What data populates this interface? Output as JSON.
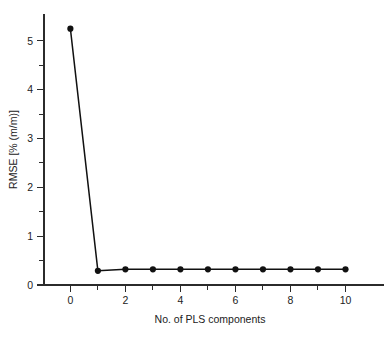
{
  "chart_data": {
    "type": "line",
    "title": "",
    "xlabel": "No. of PLS components",
    "ylabel": "RMSE [% (m/m)]",
    "x": [
      0,
      1,
      2,
      3,
      4,
      5,
      6,
      7,
      8,
      9,
      10
    ],
    "values": [
      5.25,
      0.29,
      0.32,
      0.32,
      0.32,
      0.32,
      0.32,
      0.32,
      0.32,
      0.32,
      0.32
    ],
    "series": [
      {
        "name": "RMSE",
        "values": [
          5.25,
          0.29,
          0.32,
          0.32,
          0.32,
          0.32,
          0.32,
          0.32,
          0.32,
          0.32,
          0.32
        ]
      }
    ],
    "xlim": [
      -0.45,
      10.6
    ],
    "ylim": [
      0,
      5.55
    ],
    "xticks": [
      0,
      2,
      4,
      6,
      8,
      10
    ],
    "xticklabels": [
      "0",
      "2",
      "4",
      "6",
      "8",
      "10"
    ],
    "xminorticks": [
      1,
      3,
      5,
      7,
      9
    ],
    "yticks": [
      0,
      1,
      2,
      3,
      4,
      5
    ],
    "yticklabels": [
      "0",
      "1",
      "2",
      "3",
      "4",
      "5"
    ],
    "yminorticks": [
      0.5,
      1.5,
      2.5,
      3.5,
      4.5
    ],
    "grid": false,
    "legend": false,
    "legend_position": "none",
    "marker": "circle",
    "line_color": "#111111",
    "marker_color": "#111111",
    "background_color": "#ffffff",
    "axis_color": "#2b2b2b"
  },
  "figure": {
    "name": "rmse-vs-pls-components-plot"
  }
}
